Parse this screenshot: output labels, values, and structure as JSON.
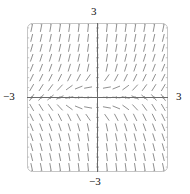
{
  "figure": {
    "kind": "slope-field",
    "name": "direction-field-plot",
    "background": "#ffffff",
    "frame": {
      "x": 27,
      "y": 23,
      "width": 141,
      "height": 149,
      "corner_radius": 5,
      "stroke": "#b8b8b8",
      "stroke_width": 0.8,
      "tick_count_x": 15,
      "tick_count_y": 15,
      "tick_length": 2.2
    },
    "axes": {
      "stroke": "#6a6a6a",
      "stroke_width": 1.0,
      "x_axis_y_px": 97.5,
      "y_axis_x_px": 97.5,
      "tick_length": 2.6
    },
    "segments": {
      "stroke": "#8a8a8a",
      "stroke_width": 0.95,
      "length_px": 8.0,
      "cols": 15,
      "rows": 15
    }
  },
  "labels": {
    "top": "3",
    "bottom": "−3",
    "left": "−3",
    "right": "3"
  },
  "chart_data": {
    "type": "scatter",
    "subtype": "slope-field",
    "title": "",
    "xlabel": "",
    "ylabel": "",
    "xlim": [
      -3,
      3
    ],
    "ylim": [
      -3,
      3
    ],
    "grid": false,
    "legend": null,
    "tick_labels": {
      "x": [
        "-3",
        "3"
      ],
      "y": [
        "-3",
        "3"
      ]
    },
    "annotations": [
      {
        "text": "3",
        "position": "top-center",
        "value": 3
      },
      {
        "text": "-3",
        "position": "bottom-center",
        "value": -3
      },
      {
        "text": "-3",
        "position": "mid-left",
        "value": -3
      },
      {
        "text": "3",
        "position": "mid-right",
        "value": 3
      }
    ],
    "slope_grid": {
      "x": [
        -2.8,
        -2.4,
        -2.0,
        -1.6,
        -1.2,
        -0.8,
        -0.4,
        0.0,
        0.4,
        0.8,
        1.2,
        1.6,
        2.0,
        2.4,
        2.8
      ],
      "y": [
        2.8,
        2.4,
        2.0,
        1.6,
        1.2,
        0.8,
        0.4,
        0.0,
        -0.4,
        -0.8,
        -1.2,
        -1.6,
        -2.0,
        -2.4,
        -2.8
      ],
      "note": "slope angle theta(x,y) measured in degrees from +x axis; rows listed top (y=2.8) to bottom (y=-2.8)",
      "angles_deg": [
        [
          78,
          79,
          80,
          81,
          82,
          83,
          84,
          85,
          84,
          83,
          82,
          81,
          80,
          79,
          78
        ],
        [
          76,
          77,
          78,
          79,
          80,
          81,
          83,
          85,
          83,
          81,
          80,
          79,
          78,
          77,
          76
        ],
        [
          74,
          75,
          76,
          77,
          78,
          80,
          82,
          85,
          82,
          80,
          78,
          77,
          76,
          75,
          74
        ],
        [
          71,
          72,
          73,
          75,
          76,
          78,
          81,
          85,
          81,
          78,
          76,
          75,
          73,
          72,
          71
        ],
        [
          68,
          69,
          70,
          71,
          73,
          75,
          78,
          85,
          78,
          75,
          73,
          71,
          70,
          69,
          68
        ],
        [
          64,
          64,
          64,
          64,
          64,
          62,
          55,
          85,
          55,
          62,
          64,
          64,
          64,
          64,
          64
        ],
        [
          60,
          58,
          54,
          47,
          36,
          22,
          10,
          85,
          10,
          22,
          36,
          47,
          54,
          58,
          60
        ],
        [
          56,
          50,
          40,
          26,
          12,
          5,
          3,
          0,
          -3,
          -5,
          -12,
          -26,
          -40,
          -50,
          -56
        ],
        [
          -60,
          -58,
          -54,
          -47,
          -36,
          -22,
          -10,
          -85,
          -10,
          -22,
          -36,
          -47,
          -54,
          -58,
          -60
        ],
        [
          -64,
          -64,
          -64,
          -64,
          -64,
          -62,
          -55,
          -85,
          -55,
          -62,
          -64,
          -64,
          -64,
          -64,
          -64
        ],
        [
          -68,
          -69,
          -70,
          -71,
          -73,
          -75,
          -78,
          -85,
          -78,
          -75,
          -73,
          -71,
          -70,
          -69,
          -68
        ],
        [
          -71,
          -72,
          -73,
          -75,
          -76,
          -78,
          -81,
          -85,
          -81,
          -78,
          -76,
          -75,
          -73,
          -72,
          -71
        ],
        [
          -74,
          -75,
          -76,
          -77,
          -78,
          -80,
          -82,
          -85,
          -82,
          -80,
          -78,
          -77,
          -76,
          -75,
          -74
        ],
        [
          -76,
          -77,
          -78,
          -79,
          -80,
          -81,
          -83,
          -85,
          -83,
          -81,
          -80,
          -79,
          -78,
          -77,
          -76
        ],
        [
          -78,
          -79,
          -80,
          -81,
          -82,
          -83,
          -84,
          -85,
          -84,
          -83,
          -82,
          -81,
          -80,
          -79,
          -78
        ]
      ]
    }
  }
}
